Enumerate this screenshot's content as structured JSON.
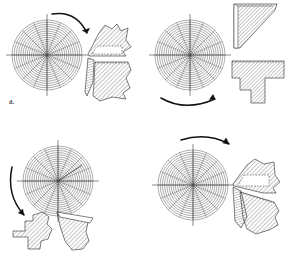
{
  "figure": {
    "title": "",
    "caption": "",
    "panel_count": 4,
    "layout": "2x2 grid",
    "background_color": "#ffffff",
    "line_color": "#1a1a1a",
    "hatch_color": "#555555"
  },
  "panels": [
    {
      "id": "a",
      "label": "a.",
      "disc": {
        "name": "polar-grid-disc",
        "center_x": 47,
        "center_y": 55,
        "radius": 35,
        "ring_count": 16,
        "spoke_count": 16,
        "axis_overhang": 9
      },
      "arrow": {
        "name": "rotation-arrow",
        "direction": "clockwise",
        "position": "top",
        "head": "down-right"
      },
      "fragments": [
        {
          "name": "fragment-wedge-upper",
          "hatched": true
        },
        {
          "name": "fragment-sliver-middle",
          "hatched": true
        },
        {
          "name": "fragment-wedge-lower",
          "hatched": true
        }
      ]
    },
    {
      "id": "b",
      "label": "b",
      "disc": {
        "name": "polar-grid-disc",
        "center_x": 47,
        "center_y": 55,
        "radius": 35,
        "ring_count": 16,
        "spoke_count": 16,
        "axis_overhang": 9
      },
      "arrow": {
        "name": "rotation-arrow",
        "direction": "clockwise",
        "position": "bottom",
        "head": "right"
      },
      "fragments": [
        {
          "name": "fragment-triangle-upper",
          "hatched": true
        },
        {
          "name": "fragment-tee-lower",
          "hatched": true
        }
      ]
    },
    {
      "id": "c",
      "label": "c",
      "disc": {
        "name": "polar-grid-disc",
        "center_x": 58,
        "center_y": 52,
        "radius": 35,
        "ring_count": 16,
        "spoke_count": 16,
        "axis_overhang": 9
      },
      "arrow": {
        "name": "rotation-arrow",
        "direction": "counter-clockwise",
        "position": "left",
        "head": "down"
      },
      "fragments": [
        {
          "name": "fragment-stepped-left",
          "hatched": true
        },
        {
          "name": "fragment-wedge-right",
          "hatched": true
        },
        {
          "name": "fragment-sliver-right",
          "hatched": true
        }
      ]
    },
    {
      "id": "d",
      "label": "d",
      "disc": {
        "name": "polar-grid-disc",
        "center_x": 50,
        "center_y": 56,
        "radius": 35,
        "ring_count": 16,
        "spoke_count": 16,
        "axis_overhang": 9
      },
      "arrow": {
        "name": "rotation-arrow",
        "direction": "clockwise",
        "position": "top",
        "head": "down-right"
      },
      "fragments": [
        {
          "name": "fragment-wedge-upper",
          "hatched": true
        },
        {
          "name": "fragment-sliver-middle",
          "hatched": true
        },
        {
          "name": "fragment-wedge-lower",
          "hatched": true
        }
      ]
    }
  ]
}
